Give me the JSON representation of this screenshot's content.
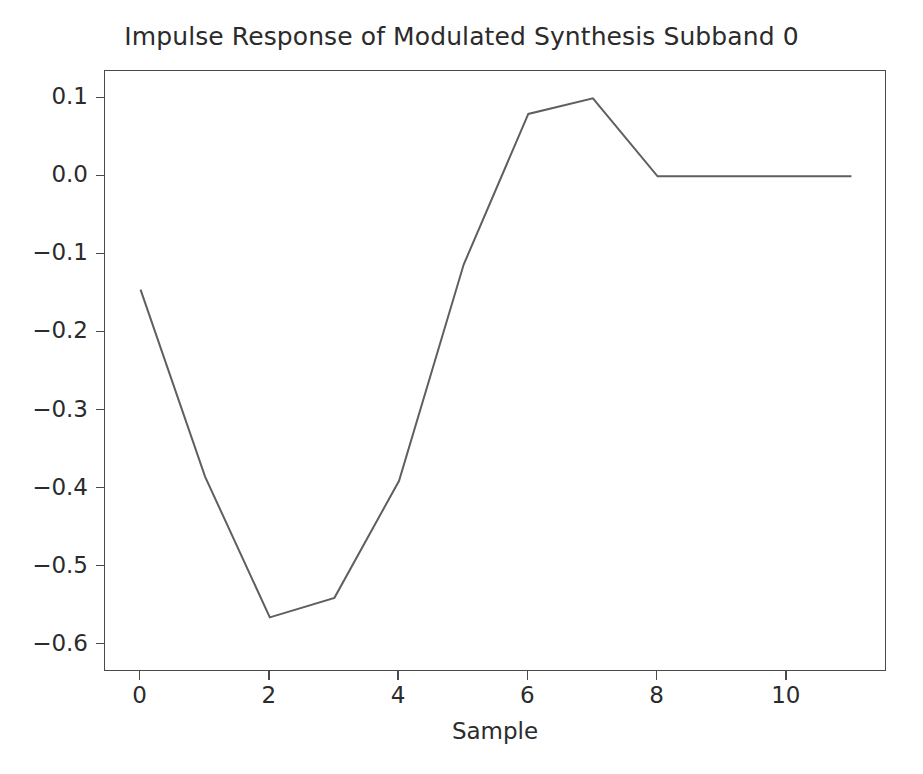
{
  "figure": {
    "background_color": "#ffffff",
    "axes_color": "#4a4a4a",
    "text_color": "#2b2b2b",
    "line_color": "#5f5f5f"
  },
  "chart_data": {
    "type": "line",
    "title": "Impulse Response of Modulated Synthesis Subband 0",
    "xlabel": "Sample",
    "ylabel": "",
    "x": [
      0,
      1,
      2,
      3,
      4,
      5,
      6,
      7,
      8,
      9,
      10,
      11
    ],
    "values": [
      -0.145,
      -0.385,
      -0.565,
      -0.54,
      -0.39,
      -0.113,
      0.08,
      0.1,
      0.0,
      0.0,
      0.0,
      0.0
    ],
    "series": [
      {
        "name": "impulse response",
        "values": [
          -0.145,
          -0.385,
          -0.565,
          -0.54,
          -0.39,
          -0.113,
          0.08,
          0.1,
          0.0,
          0.0,
          0.0,
          0.0
        ]
      }
    ],
    "xlim": [
      -0.55,
      11.55
    ],
    "ylim": [
      -0.635,
      0.135
    ],
    "xticks": [
      0,
      2,
      4,
      6,
      8,
      10
    ],
    "xtick_labels": [
      "0",
      "2",
      "4",
      "6",
      "8",
      "10"
    ],
    "yticks": [
      0.1,
      0.0,
      -0.1,
      -0.2,
      -0.3,
      -0.4,
      -0.5,
      -0.6
    ],
    "ytick_labels": [
      "0.1",
      "0.0",
      "−0.1",
      "−0.2",
      "−0.3",
      "−0.4",
      "−0.5",
      "−0.6"
    ],
    "grid": false,
    "legend": null,
    "line_color": "#5f5f5f",
    "line_width": 2.0,
    "markers": false
  }
}
